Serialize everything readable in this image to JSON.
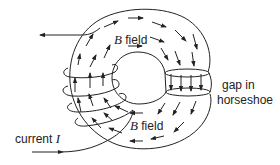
{
  "diagram": {
    "labels": {
      "top_field_symbol": "B",
      "top_field_text": " field",
      "bottom_field_symbol": "B",
      "bottom_field_text": " field",
      "gap_line1": "gap in",
      "gap_line2": "horseshoe",
      "current_text": "current ",
      "current_symbol": "I"
    },
    "elements": {
      "core": "toroidal iron core (horseshoe) with a gap on the right",
      "coil": "wire coil wound around the left side of the core",
      "field_direction": "clockwise",
      "current_direction_in": "rightward into coil (bottom lead)",
      "current_direction_out": "leftward out of coil (top lead)"
    },
    "colors": {
      "stroke": "#222222",
      "background": "#ffffff"
    }
  }
}
